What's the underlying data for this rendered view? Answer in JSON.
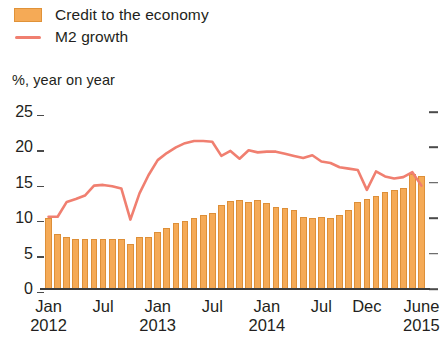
{
  "legend": {
    "items": [
      {
        "label": "Credit to the economy",
        "marker": "bar-swatch",
        "color": "#f5aa56"
      },
      {
        "label": "M2 growth",
        "marker": "line-swatch",
        "color": "#f07f70"
      }
    ]
  },
  "axis": {
    "unit_caption": "%, year on year"
  },
  "chart_data": {
    "type": "bar",
    "title": "",
    "subtitle": "",
    "xlabel": "",
    "ylabel": "%, year on year",
    "ylim": [
      0,
      25
    ],
    "yticks": [
      0,
      5,
      10,
      15,
      20,
      25
    ],
    "ytick_labels": [
      "0",
      "5",
      "10",
      "15",
      "20",
      "25"
    ],
    "grid": false,
    "legend_position": "above-top-left",
    "right_axis_ticks": true,
    "x": [
      "Jan 2012",
      "Feb 2012",
      "Mar 2012",
      "Apr 2012",
      "May 2012",
      "Jun 2012",
      "Jul 2012",
      "Aug 2012",
      "Sep 2012",
      "Oct 2012",
      "Nov 2012",
      "Dec 2012",
      "Jan 2013",
      "Feb 2013",
      "Mar 2013",
      "Apr 2013",
      "May 2013",
      "Jun 2013",
      "Jul 2013",
      "Aug 2013",
      "Sep 2013",
      "Oct 2013",
      "Nov 2013",
      "Dec 2013",
      "Jan 2014",
      "Feb 2014",
      "Mar 2014",
      "Apr 2014",
      "May 2014",
      "Jun 2014",
      "Jul 2014",
      "Aug 2014",
      "Sep 2014",
      "Oct 2014",
      "Nov 2014",
      "Dec 2014",
      "Jan 2015",
      "Feb 2015",
      "Mar 2015",
      "Apr 2015",
      "May 2015",
      "Jun 2015"
    ],
    "xtick_labels": [
      {
        "index": 0,
        "label": "Jan",
        "year": "2012"
      },
      {
        "index": 6,
        "label": "Jul",
        "year": ""
      },
      {
        "index": 12,
        "label": "Jan",
        "year": "2013"
      },
      {
        "index": 18,
        "label": "Jul",
        "year": ""
      },
      {
        "index": 24,
        "label": "Jan",
        "year": "2014"
      },
      {
        "index": 30,
        "label": "Jul",
        "year": ""
      },
      {
        "index": 35,
        "label": "Dec",
        "year": ""
      },
      {
        "index": 41,
        "label": "June",
        "year": "2015"
      }
    ],
    "series": [
      {
        "name": "Credit to the economy",
        "type": "bar",
        "color": "#f5aa56",
        "values": [
          10.1,
          7.7,
          7.4,
          7.1,
          7.0,
          7.0,
          7.0,
          7.1,
          7.1,
          6.4,
          7.3,
          7.3,
          8.0,
          8.6,
          9.3,
          9.6,
          10.0,
          10.4,
          10.7,
          11.8,
          12.5,
          12.6,
          12.3,
          12.6,
          12.2,
          11.6,
          11.4,
          11.2,
          10.2,
          10.0,
          10.2,
          10.0,
          10.4,
          11.1,
          12.3,
          12.7,
          13.1,
          13.7,
          14.0,
          14.2,
          16.2,
          15.9
        ]
      },
      {
        "name": "M2 growth",
        "type": "line",
        "color": "#f07f70",
        "values": [
          10.2,
          10.2,
          12.3,
          12.7,
          13.2,
          14.6,
          14.7,
          14.5,
          14.2,
          9.8,
          13.5,
          16.1,
          18.2,
          19.2,
          20.0,
          20.6,
          20.9,
          20.9,
          20.8,
          18.8,
          19.5,
          18.4,
          19.6,
          19.3,
          19.4,
          19.4,
          19.1,
          18.8,
          18.5,
          18.9,
          18.0,
          17.8,
          17.2,
          17.0,
          16.8,
          14.0,
          16.6,
          15.9,
          15.6,
          15.8,
          16.5,
          14.6
        ]
      }
    ]
  }
}
